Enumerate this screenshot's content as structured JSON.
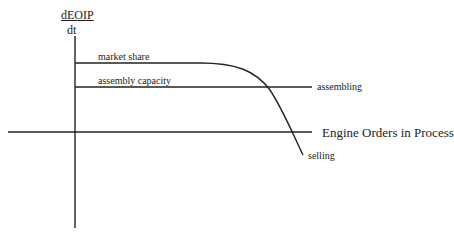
{
  "diagram": {
    "y_axis_label": {
      "numerator": "dEOIP",
      "denominator": "dt"
    },
    "x_axis_label": "Engine Orders in Process",
    "curves": {
      "market_share": "market share",
      "assembly_capacity": "assembly capacity",
      "assembling": "assembling",
      "selling": "selling"
    },
    "colors": {
      "line": "#222222",
      "background": "#ffffff"
    }
  }
}
